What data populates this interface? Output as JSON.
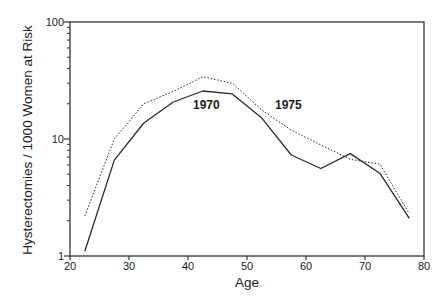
{
  "chart_data": {
    "type": "line",
    "title": "",
    "xlabel": "Age",
    "ylabel": "Hysterectomies / 1000 Women at Risk",
    "xlim": [
      20,
      80
    ],
    "ylim": [
      1,
      100
    ],
    "yscale": "log",
    "grid": false,
    "legend": "inline labels",
    "x_ticks": [
      20,
      30,
      40,
      50,
      60,
      70,
      80
    ],
    "y_ticks": [
      1,
      10,
      100
    ],
    "x": [
      22.5,
      27.5,
      32.5,
      37.5,
      42.5,
      47.5,
      52.5,
      57.5,
      62.5,
      67.5,
      72.5,
      77.5
    ],
    "series": [
      {
        "name": "1970",
        "style": "solid",
        "values": [
          1.1,
          6.6,
          13.7,
          20.7,
          25.7,
          24.3,
          15.1,
          7.3,
          5.6,
          7.5,
          5.1,
          2.1
        ]
      },
      {
        "name": "1975",
        "style": "dotted",
        "values": [
          2.2,
          10.0,
          20.0,
          25.5,
          34.0,
          30.0,
          17.7,
          11.9,
          8.9,
          6.7,
          6.1,
          2.3
        ]
      }
    ],
    "annotations": [
      {
        "text": "1970",
        "x": 43.5,
        "y": 20
      },
      {
        "text": "1975",
        "x": 57.5,
        "y": 20
      }
    ]
  },
  "labels": {
    "xlabel": "Age",
    "ylabel": "Hysterectomies / 1000 Women at Risk",
    "series_1970": "1970",
    "series_1975": "1975"
  }
}
